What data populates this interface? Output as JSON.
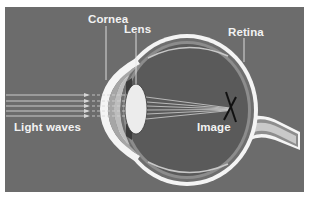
{
  "diagram": {
    "labels": {
      "cornea": "Cornea",
      "lens": "Lens",
      "retina": "Retina",
      "light_waves": "Light waves",
      "image": "Image"
    },
    "colors": {
      "background": "#6c6c6c",
      "eye_interior": "#5a5a5a",
      "sclera": "#f4f4f4",
      "retina_layer": "#8a8a8a",
      "lens": "#ececec",
      "light_rays": "#d8d8d8",
      "image_mark": "#111111",
      "label_text": "#f2f2f2"
    },
    "light_rays_count": 6,
    "focal_point": {
      "x": 230,
      "y": 109
    }
  }
}
